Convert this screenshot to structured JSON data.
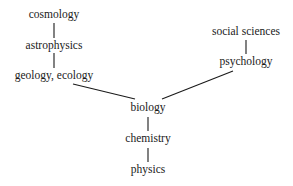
{
  "diagram": {
    "nodes": [
      {
        "id": "cosmology",
        "label": "cosmology"
      },
      {
        "id": "astrophysics",
        "label": "astrophysics"
      },
      {
        "id": "geology_ecology",
        "label": "geology, ecology"
      },
      {
        "id": "social_sciences",
        "label": "social sciences"
      },
      {
        "id": "psychology",
        "label": "psychology"
      },
      {
        "id": "biology",
        "label": "biology"
      },
      {
        "id": "chemistry",
        "label": "chemistry"
      },
      {
        "id": "physics",
        "label": "physics"
      }
    ],
    "edges": [
      {
        "from": "cosmology",
        "to": "astrophysics"
      },
      {
        "from": "astrophysics",
        "to": "geology_ecology"
      },
      {
        "from": "geology_ecology",
        "to": "biology"
      },
      {
        "from": "social_sciences",
        "to": "psychology"
      },
      {
        "from": "psychology",
        "to": "biology"
      },
      {
        "from": "biology",
        "to": "chemistry"
      },
      {
        "from": "chemistry",
        "to": "physics"
      }
    ]
  }
}
